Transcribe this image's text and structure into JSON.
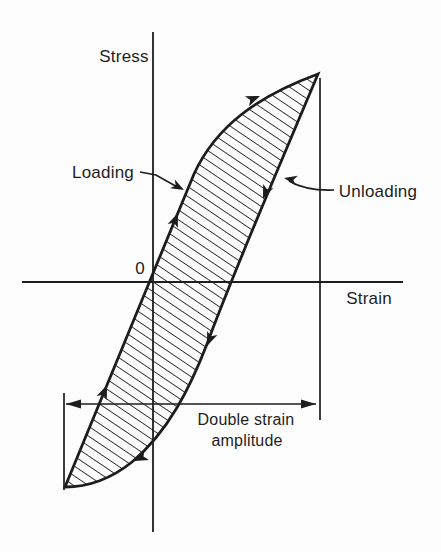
{
  "figure": {
    "y_axis_label": "Stress",
    "x_axis_label": "Strain",
    "origin_label": "0",
    "loading_label": "Loading",
    "unloading_label": "Unloading",
    "dimension_label_line1": "Double strain",
    "dimension_label_line2": "amplitude",
    "ink": "#1d1d1d",
    "background": "#fdfdfd"
  },
  "icons": {
    "flow_arrow": "solid-barbed-arrowhead-along-curve",
    "dimension_arrow": "solid-triangle-arrowhead",
    "leader_arrow": "solid-barbed-arrowhead-on-leader-line"
  },
  "geometry": {
    "canvas": {
      "width": 441,
      "height": 552
    },
    "stress_axis": {
      "x": 153,
      "y1": 32,
      "y2": 532
    },
    "strain_axis": {
      "y": 282,
      "x1": 22,
      "x2": 403
    },
    "loop_path": "M 65 487 C 100 402 155 268 194 174 C 216 126 258 96 318 74 C 282 160 235 268 207 344 C 190 388 168 432 132 462 C 112 478 88 487 65 487 Z",
    "hatch": {
      "angle": 34,
      "spacing": 8.2,
      "stroke_width": 1.7
    },
    "right_marker": {
      "x": 320,
      "y1": 78,
      "y2": 420
    },
    "left_marker": {
      "x": 64,
      "y1": 393,
      "y2": 490
    },
    "dimension_line": {
      "y": 404,
      "x1": 66,
      "x2": 316
    },
    "flow_arrows": [
      {
        "x": 178,
        "y": 213,
        "angle": -68
      },
      {
        "x": 260,
        "y": 96,
        "angle": -22
      },
      {
        "x": 107,
        "y": 385,
        "angle": -68
      },
      {
        "x": 263,
        "y": 199,
        "angle": 112
      },
      {
        "x": 207,
        "y": 346,
        "angle": 112
      },
      {
        "x": 134,
        "y": 461,
        "angle": 155
      }
    ],
    "loading_leader": {
      "path": "M 140 172 L 156 175 L 179 188",
      "tip_x": 184,
      "tip_y": 190,
      "tip_angle": 28
    },
    "unloading_leader": {
      "path": "M 334 190 Q 306 191 289 181",
      "tip_x": 284,
      "tip_y": 178,
      "tip_angle": -168
    }
  }
}
